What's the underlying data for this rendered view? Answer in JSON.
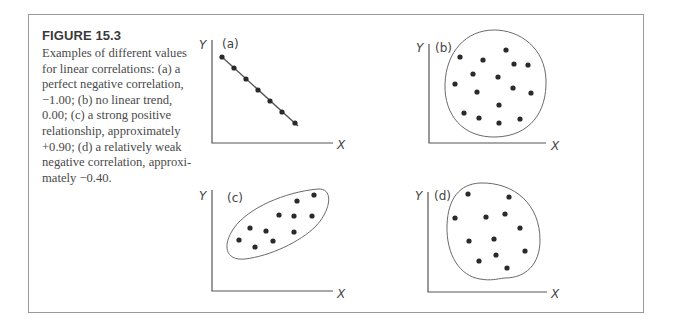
{
  "figure": {
    "title": "FIGURE 15.3",
    "caption_lines": [
      "Examples of different values",
      "for linear correlations: (a) a",
      "perfect negative correlation,",
      "−1.00; (b) no linear trend,",
      "0.00; (c) a strong positive",
      "relationship, approximately",
      "+0.90; (d) a relatively weak",
      "negative correlation, approxi-",
      "mately −0.40."
    ]
  },
  "colors": {
    "frame": "#9a9a9a",
    "axis": "#555555",
    "point": "#2a2a2a",
    "text": "#444444"
  },
  "panels": [
    {
      "id": "a",
      "label": "(a)",
      "x_label": "X",
      "y_label": "Y",
      "correlation": -1.0,
      "description": "perfect negative correlation",
      "axis": {
        "x0": 212,
        "ytop": 40,
        "ybottom": 143,
        "xright": 333
      },
      "label_pos": [
        222,
        48
      ],
      "ylabel_pos": [
        199,
        49
      ],
      "xlabel_pos": [
        337,
        149
      ],
      "trend_line": [
        [
          222,
          57
        ],
        [
          298,
          126
        ]
      ],
      "boundary": null,
      "points": [
        [
          222,
          57
        ],
        [
          234,
          68
        ],
        [
          246,
          79
        ],
        [
          258,
          90
        ],
        [
          270,
          101
        ],
        [
          282,
          112
        ],
        [
          295,
          123
        ]
      ]
    },
    {
      "id": "b",
      "label": "(b)",
      "x_label": "X",
      "y_label": "Y",
      "correlation": 0.0,
      "description": "no linear trend",
      "axis": {
        "x0": 429,
        "ytop": 44,
        "ybottom": 143,
        "xright": 546
      },
      "label_pos": [
        435,
        52
      ],
      "ylabel_pos": [
        416,
        52
      ],
      "xlabel_pos": [
        551,
        150
      ],
      "trend_line": null,
      "boundary": "M 494 30 C 520 30, 545 48, 546 80 C 547 112, 530 136, 496 137 C 463 138, 444 115, 445 84 C 446 52, 466 30, 494 30 Z",
      "points": [
        [
          460,
          57
        ],
        [
          483,
          60
        ],
        [
          506,
          50
        ],
        [
          514,
          64
        ],
        [
          528,
          65
        ],
        [
          473,
          74
        ],
        [
          498,
          77
        ],
        [
          455,
          84
        ],
        [
          513,
          88
        ],
        [
          477,
          92
        ],
        [
          531,
          93
        ],
        [
          499,
          105
        ],
        [
          464,
          113
        ],
        [
          479,
          118
        ],
        [
          499,
          123
        ],
        [
          520,
          119
        ]
      ]
    },
    {
      "id": "c",
      "label": "(c)",
      "x_label": "X",
      "y_label": "Y",
      "correlation": 0.9,
      "description": "strong positive relationship, approximately +0.90",
      "axis": {
        "x0": 212,
        "ytop": 190,
        "ybottom": 291,
        "xright": 333
      },
      "label_pos": [
        227,
        202
      ],
      "ylabel_pos": [
        199,
        200
      ],
      "xlabel_pos": [
        337,
        298
      ],
      "trend_line": null,
      "boundary": "M 318 189 C 334 188, 331 210, 316 226 C 300 242, 270 256, 245 259 C 225 261, 222 245, 234 228 C 248 208, 285 192, 318 189 Z",
      "points": [
        [
          239,
          240
        ],
        [
          250,
          228
        ],
        [
          255,
          247
        ],
        [
          266,
          231
        ],
        [
          273,
          241
        ],
        [
          279,
          215
        ],
        [
          294,
          216
        ],
        [
          297,
          201
        ],
        [
          294,
          232
        ],
        [
          312,
          216
        ],
        [
          314,
          195
        ]
      ]
    },
    {
      "id": "d",
      "label": "(d)",
      "x_label": "X",
      "y_label": "Y",
      "correlation": -0.4,
      "description": "relatively weak negative correlation, approximately -0.40",
      "axis": {
        "x0": 428,
        "ytop": 192,
        "ybottom": 292,
        "xright": 547
      },
      "label_pos": [
        434,
        200
      ],
      "ylabel_pos": [
        415,
        200
      ],
      "xlabel_pos": [
        551,
        298
      ],
      "trend_line": null,
      "boundary": "M 480 183 C 515 182, 540 205, 540 240 C 540 265, 525 278, 505 278 C 495 279, 492 281, 480 279 C 460 276, 446 255, 447 225 C 448 198, 460 184, 480 183 Z",
      "points": [
        [
          468,
          194
        ],
        [
          509,
          197
        ],
        [
          455,
          218
        ],
        [
          486,
          217
        ],
        [
          505,
          214
        ],
        [
          520,
          228
        ],
        [
          469,
          241
        ],
        [
          494,
          239
        ],
        [
          525,
          251
        ],
        [
          479,
          261
        ],
        [
          496,
          255
        ],
        [
          507,
          268
        ]
      ]
    }
  ]
}
